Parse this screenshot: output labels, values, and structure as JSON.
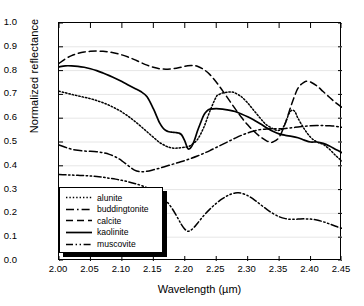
{
  "chart_data": {
    "type": "line",
    "title": "",
    "xlabel": "Wavelength (µm)",
    "ylabel": "Normalized reflectance",
    "xlim": [
      2.0,
      2.45
    ],
    "ylim": [
      0.0,
      1.0
    ],
    "xticks": [
      "2.00",
      "2.05",
      "2.10",
      "2.15",
      "2.20",
      "2.25",
      "2.30",
      "2.35",
      "2.40",
      "2.45"
    ],
    "yticks": [
      "0.0",
      "0.1",
      "0.2",
      "0.3",
      "0.4",
      "0.5",
      "0.6",
      "0.7",
      "0.8",
      "0.9",
      "1.0"
    ],
    "grid": "horizontal",
    "legend_position": "lower-left",
    "series": [
      {
        "name": "alunite",
        "style": "dotted",
        "color": "#000000",
        "x": [
          2.0,
          2.01,
          2.02,
          2.03,
          2.04,
          2.05,
          2.06,
          2.07,
          2.08,
          2.09,
          2.1,
          2.11,
          2.12,
          2.13,
          2.14,
          2.15,
          2.16,
          2.17,
          2.175,
          2.18,
          2.185,
          2.19,
          2.2,
          2.205,
          2.21,
          2.22,
          2.23,
          2.24,
          2.25,
          2.255,
          2.26,
          2.27,
          2.275,
          2.28,
          2.29,
          2.3,
          2.31,
          2.32,
          2.325,
          2.33,
          2.34,
          2.345,
          2.35,
          2.355,
          2.36,
          2.365,
          2.37,
          2.375,
          2.38,
          2.39,
          2.4,
          2.41,
          2.42,
          2.43,
          2.44,
          2.45
        ],
        "y": [
          0.713,
          0.707,
          0.7,
          0.694,
          0.688,
          0.682,
          0.674,
          0.665,
          0.654,
          0.641,
          0.626,
          0.608,
          0.588,
          0.566,
          0.543,
          0.52,
          0.498,
          0.483,
          0.478,
          0.475,
          0.474,
          0.475,
          0.478,
          0.48,
          0.487,
          0.51,
          0.56,
          0.63,
          0.69,
          0.7,
          0.706,
          0.71,
          0.71,
          0.706,
          0.69,
          0.664,
          0.632,
          0.6,
          0.585,
          0.572,
          0.556,
          0.55,
          0.549,
          0.556,
          0.58,
          0.615,
          0.633,
          0.628,
          0.6,
          0.555,
          0.52,
          0.5,
          0.49,
          0.47,
          0.443,
          0.42
        ]
      },
      {
        "name": "buddingtonite",
        "style": "dash-dot",
        "color": "#000000",
        "x": [
          2.0,
          2.01,
          2.02,
          2.03,
          2.04,
          2.05,
          2.06,
          2.07,
          2.08,
          2.09,
          2.1,
          2.11,
          2.12,
          2.13,
          2.14,
          2.15,
          2.16,
          2.17,
          2.18,
          2.19,
          2.2,
          2.21,
          2.22,
          2.23,
          2.24,
          2.25,
          2.26,
          2.27,
          2.28,
          2.29,
          2.3,
          2.31,
          2.32,
          2.33,
          2.34,
          2.35,
          2.36,
          2.37,
          2.38,
          2.39,
          2.4,
          2.41,
          2.42,
          2.43,
          2.44,
          2.45
        ],
        "y": [
          0.488,
          0.478,
          0.47,
          0.465,
          0.462,
          0.461,
          0.459,
          0.455,
          0.448,
          0.437,
          0.421,
          0.401,
          0.382,
          0.375,
          0.377,
          0.383,
          0.39,
          0.398,
          0.406,
          0.414,
          0.422,
          0.431,
          0.441,
          0.452,
          0.464,
          0.477,
          0.49,
          0.503,
          0.516,
          0.528,
          0.538,
          0.546,
          0.552,
          0.555,
          0.556,
          0.556,
          0.557,
          0.56,
          0.563,
          0.566,
          0.568,
          0.569,
          0.569,
          0.568,
          0.566,
          0.562
        ]
      },
      {
        "name": "calcite",
        "style": "dashed",
        "color": "#000000",
        "x": [
          2.0,
          2.01,
          2.02,
          2.03,
          2.04,
          2.05,
          2.06,
          2.07,
          2.08,
          2.09,
          2.1,
          2.11,
          2.12,
          2.13,
          2.14,
          2.15,
          2.16,
          2.17,
          2.18,
          2.19,
          2.2,
          2.21,
          2.215,
          2.22,
          2.23,
          2.24,
          2.25,
          2.26,
          2.27,
          2.28,
          2.29,
          2.3,
          2.31,
          2.32,
          2.33,
          2.335,
          2.34,
          2.35,
          2.36,
          2.37,
          2.38,
          2.39,
          2.395,
          2.4,
          2.41,
          2.42,
          2.43,
          2.44,
          2.45
        ],
        "y": [
          0.83,
          0.849,
          0.863,
          0.872,
          0.878,
          0.881,
          0.882,
          0.881,
          0.878,
          0.873,
          0.866,
          0.857,
          0.846,
          0.834,
          0.823,
          0.814,
          0.808,
          0.806,
          0.808,
          0.812,
          0.818,
          0.821,
          0.821,
          0.818,
          0.805,
          0.783,
          0.752,
          0.716,
          0.678,
          0.64,
          0.604,
          0.572,
          0.545,
          0.522,
          0.505,
          0.5,
          0.5,
          0.52,
          0.58,
          0.66,
          0.726,
          0.752,
          0.755,
          0.752,
          0.736,
          0.712,
          0.688,
          0.665,
          0.645
        ]
      },
      {
        "name": "kaolinite",
        "style": "solid",
        "color": "#000000",
        "x": [
          2.0,
          2.01,
          2.02,
          2.03,
          2.04,
          2.05,
          2.06,
          2.07,
          2.08,
          2.09,
          2.1,
          2.11,
          2.12,
          2.13,
          2.14,
          2.15,
          2.155,
          2.16,
          2.165,
          2.17,
          2.175,
          2.18,
          2.185,
          2.19,
          2.195,
          2.2,
          2.205,
          2.21,
          2.215,
          2.22,
          2.225,
          2.23,
          2.235,
          2.24,
          2.25,
          2.26,
          2.27,
          2.28,
          2.29,
          2.3,
          2.31,
          2.32,
          2.33,
          2.34,
          2.35,
          2.36,
          2.37,
          2.38,
          2.39,
          2.4,
          2.41,
          2.42,
          2.43,
          2.44,
          2.45
        ],
        "y": [
          0.816,
          0.82,
          0.82,
          0.818,
          0.814,
          0.808,
          0.8,
          0.79,
          0.779,
          0.767,
          0.754,
          0.74,
          0.726,
          0.712,
          0.69,
          0.64,
          0.61,
          0.58,
          0.56,
          0.548,
          0.543,
          0.541,
          0.54,
          0.538,
          0.53,
          0.505,
          0.472,
          0.478,
          0.505,
          0.545,
          0.58,
          0.612,
          0.63,
          0.638,
          0.64,
          0.638,
          0.634,
          0.628,
          0.618,
          0.606,
          0.592,
          0.577,
          0.56,
          0.545,
          0.534,
          0.528,
          0.524,
          0.518,
          0.508,
          0.5,
          0.5,
          0.494,
          0.483,
          0.469,
          0.455
        ]
      },
      {
        "name": "muscovite",
        "style": "dash-dot-dot",
        "color": "#000000",
        "x": [
          2.0,
          2.01,
          2.02,
          2.03,
          2.04,
          2.05,
          2.06,
          2.07,
          2.08,
          2.09,
          2.1,
          2.11,
          2.12,
          2.13,
          2.14,
          2.15,
          2.16,
          2.17,
          2.18,
          2.19,
          2.195,
          2.2,
          2.205,
          2.21,
          2.215,
          2.22,
          2.23,
          2.24,
          2.25,
          2.26,
          2.27,
          2.28,
          2.285,
          2.29,
          2.3,
          2.31,
          2.32,
          2.33,
          2.34,
          2.35,
          2.36,
          2.37,
          2.38,
          2.39,
          2.4,
          2.41,
          2.42,
          2.43,
          2.44,
          2.45
        ],
        "y": [
          0.363,
          0.362,
          0.361,
          0.36,
          0.359,
          0.357,
          0.355,
          0.352,
          0.348,
          0.344,
          0.339,
          0.333,
          0.326,
          0.318,
          0.308,
          0.295,
          0.278,
          0.254,
          0.22,
          0.175,
          0.152,
          0.134,
          0.125,
          0.13,
          0.142,
          0.158,
          0.19,
          0.218,
          0.242,
          0.262,
          0.277,
          0.286,
          0.287,
          0.285,
          0.275,
          0.258,
          0.238,
          0.218,
          0.2,
          0.186,
          0.178,
          0.175,
          0.176,
          0.177,
          0.176,
          0.172,
          0.165,
          0.156,
          0.146,
          0.137
        ]
      }
    ]
  },
  "legend": {
    "items": [
      {
        "label": "alunite",
        "style": "dotted"
      },
      {
        "label": "buddingtonite",
        "style": "dash-dot"
      },
      {
        "label": "calcite",
        "style": "dashed"
      },
      {
        "label": "kaolinite",
        "style": "solid"
      },
      {
        "label": "muscovite",
        "style": "dash-dot-dot"
      }
    ]
  }
}
